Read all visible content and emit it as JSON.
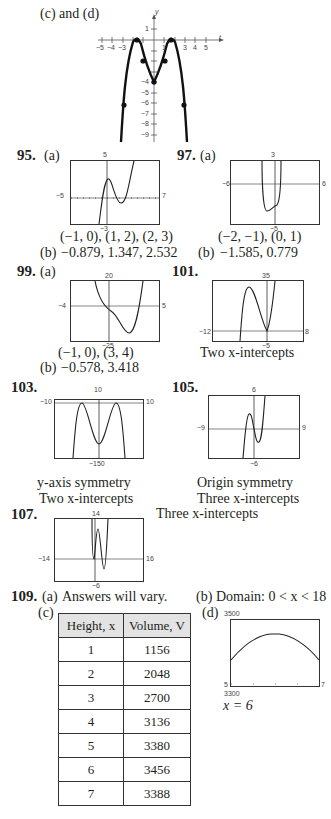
{
  "top_graph": {
    "label": "(c) and (d)",
    "y_axis_label": "y",
    "x_axis_label": "t",
    "x_ticks": [
      "−5",
      "−4",
      "−3",
      "1",
      "3",
      "4",
      "5"
    ],
    "y_ticks": [
      "1",
      "−4",
      "−5",
      "−6",
      "−7",
      "−8",
      "−9"
    ]
  },
  "problems": {
    "p95": {
      "number": "95.",
      "part_a": "(a)",
      "window": {
        "ymax": "5",
        "xmin": "−5",
        "xmax": "7",
        "ymin": "−3"
      },
      "intervals": "(−1, 0), (1, 2), (2, 3)",
      "part_b": "(b)",
      "zeros": "−0.879, 1.347, 2.532"
    },
    "p97": {
      "number": "97.",
      "part_a": "(a)",
      "window": {
        "ymax": "3",
        "xmin": "−6",
        "xmax": "6",
        "ymin": "−5"
      },
      "intervals": "(−2, −1), (0, 1)",
      "part_b": "(b)",
      "zeros": "−1.585, 0.779"
    },
    "p99": {
      "number": "99.",
      "part_a": "(a)",
      "window": {
        "ymax": "20",
        "xmin": "−4",
        "xmax": "5",
        "ymin": "−25"
      },
      "intervals": "(−1, 0), (3, 4)",
      "part_b": "(b)",
      "zeros": "−0.578, 3.418"
    },
    "p101": {
      "number": "101.",
      "window": {
        "ymax": "35",
        "xmin": "−12",
        "xmax": "8",
        "ymin": "−5"
      },
      "note": "Two x-intercepts"
    },
    "p103": {
      "number": "103.",
      "window": {
        "ymax": "10",
        "xmin": "−10",
        "xmax": "10",
        "ymin": "−150"
      },
      "note1": "y-axis symmetry",
      "note2": "Two x-intercepts"
    },
    "p105": {
      "number": "105.",
      "window": {
        "ymax": "6",
        "xmin": "−9",
        "xmax": "9",
        "ymin": "−6"
      },
      "note1": "Origin symmetry",
      "note2": "Three x-intercepts"
    },
    "p107": {
      "number": "107.",
      "window": {
        "ymax": "14",
        "xmin": "−14",
        "xmax": "16",
        "ymin": "−6"
      },
      "note": "Three x-intercepts"
    },
    "p109": {
      "number": "109.",
      "part_a": "(a)",
      "answer_a": "Answers will vary.",
      "part_b": "(b)",
      "answer_b": "Domain:  0 < x < 18",
      "part_c": "(c)",
      "table_headers": [
        "Height, x",
        "Volume, V"
      ],
      "table_rows": [
        [
          "1",
          "1156"
        ],
        [
          "2",
          "2048"
        ],
        [
          "3",
          "2700"
        ],
        [
          "4",
          "3136"
        ],
        [
          "5",
          "3380"
        ],
        [
          "6",
          "3456"
        ],
        [
          "7",
          "3388"
        ]
      ],
      "part_d": "(d)",
      "window": {
        "ymax": "3500",
        "xmin": "5",
        "xmax": "7",
        "ymin": "3300"
      },
      "answer_d": "x = 6"
    }
  }
}
